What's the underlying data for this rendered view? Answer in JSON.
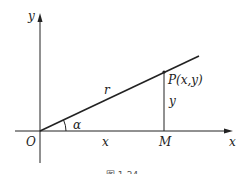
{
  "diagram": {
    "labels": {
      "y_axis": "y",
      "x_axis": "x",
      "origin": "O",
      "angle": "α",
      "radius": "r",
      "point": "P(x,y)",
      "vertical_segment": "y",
      "horizontal_segment": "x",
      "foot": "M"
    },
    "caption": "图 1-24",
    "colors": {
      "stroke": "#222222"
    }
  }
}
